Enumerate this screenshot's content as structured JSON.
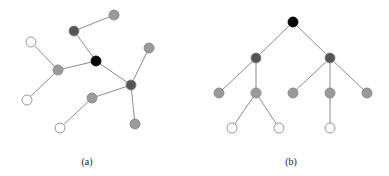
{
  "colors": {
    "edge": "#8c8c8c",
    "black": "#000000",
    "dark": "#555555",
    "gray": "#9a9a9a",
    "white": "#ffffff",
    "stroke": "#808080"
  },
  "graphs": [
    {
      "id": "a",
      "label": "(a)",
      "label_pos": [
        87,
        156
      ],
      "nodes": [
        {
          "id": "a0",
          "x": 96,
          "y": 61,
          "type": "black"
        },
        {
          "id": "a1",
          "x": 74,
          "y": 31,
          "type": "dark"
        },
        {
          "id": "a2",
          "x": 114,
          "y": 15,
          "type": "gray"
        },
        {
          "id": "a3",
          "x": 58,
          "y": 70,
          "type": "gray"
        },
        {
          "id": "a4",
          "x": 31,
          "y": 42,
          "type": "white"
        },
        {
          "id": "a5",
          "x": 27,
          "y": 100,
          "type": "white"
        },
        {
          "id": "a6",
          "x": 131,
          "y": 85,
          "type": "dark"
        },
        {
          "id": "a7",
          "x": 149,
          "y": 48,
          "type": "gray"
        },
        {
          "id": "a8",
          "x": 135,
          "y": 124,
          "type": "gray"
        },
        {
          "id": "a9",
          "x": 92,
          "y": 98,
          "type": "gray"
        },
        {
          "id": "a10",
          "x": 60,
          "y": 128,
          "type": "white"
        }
      ],
      "edges": [
        [
          "a0",
          "a1"
        ],
        [
          "a1",
          "a2"
        ],
        [
          "a0",
          "a3"
        ],
        [
          "a3",
          "a4"
        ],
        [
          "a3",
          "a5"
        ],
        [
          "a0",
          "a6"
        ],
        [
          "a6",
          "a7"
        ],
        [
          "a6",
          "a8"
        ],
        [
          "a6",
          "a9"
        ],
        [
          "a9",
          "a10"
        ]
      ]
    },
    {
      "id": "b",
      "label": "(b)",
      "label_pos": [
        291,
        156
      ],
      "nodes": [
        {
          "id": "b0",
          "x": 293,
          "y": 22,
          "type": "black"
        },
        {
          "id": "b1",
          "x": 256,
          "y": 58,
          "type": "dark"
        },
        {
          "id": "b2",
          "x": 330,
          "y": 58,
          "type": "dark"
        },
        {
          "id": "b3",
          "x": 219,
          "y": 93,
          "type": "gray"
        },
        {
          "id": "b4",
          "x": 256,
          "y": 93,
          "type": "gray"
        },
        {
          "id": "b5",
          "x": 293,
          "y": 93,
          "type": "gray"
        },
        {
          "id": "b6",
          "x": 330,
          "y": 93,
          "type": "gray"
        },
        {
          "id": "b7",
          "x": 367,
          "y": 93,
          "type": "gray"
        },
        {
          "id": "b8",
          "x": 232,
          "y": 128,
          "type": "white"
        },
        {
          "id": "b9",
          "x": 279,
          "y": 128,
          "type": "white"
        },
        {
          "id": "b10",
          "x": 330,
          "y": 128,
          "type": "white"
        }
      ],
      "edges": [
        [
          "b0",
          "b1"
        ],
        [
          "b0",
          "b2"
        ],
        [
          "b1",
          "b3"
        ],
        [
          "b1",
          "b4"
        ],
        [
          "b2",
          "b5"
        ],
        [
          "b2",
          "b6"
        ],
        [
          "b2",
          "b7"
        ],
        [
          "b4",
          "b8"
        ],
        [
          "b4",
          "b9"
        ],
        [
          "b6",
          "b10"
        ]
      ]
    }
  ],
  "node_radius": 5
}
